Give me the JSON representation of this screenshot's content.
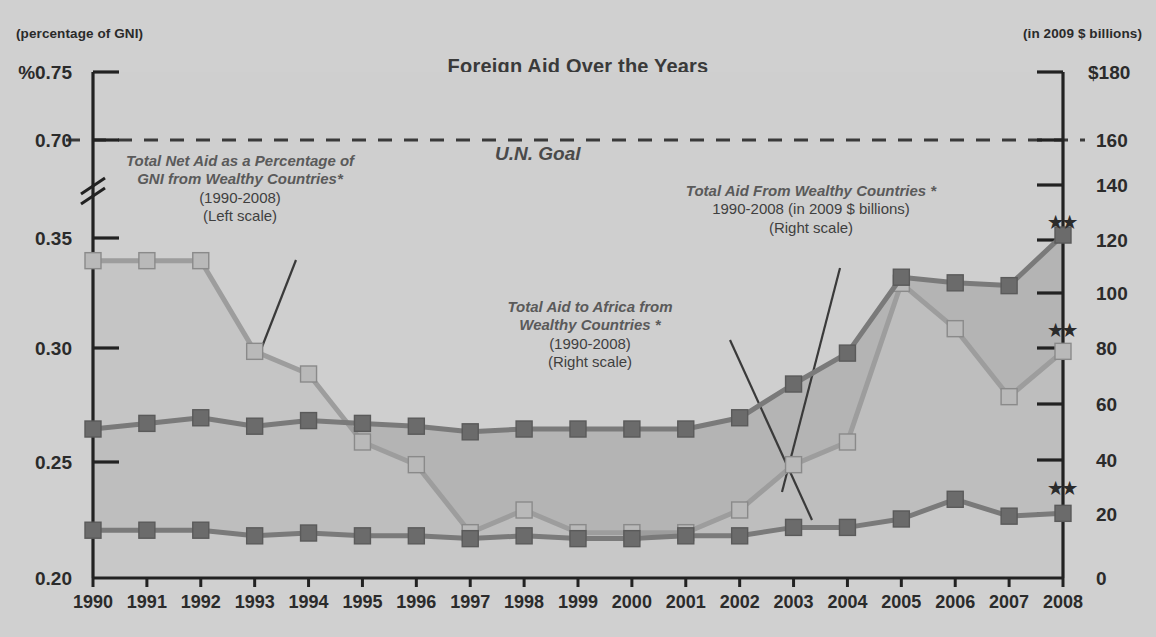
{
  "header": {
    "left_unit_label": "(percentage of GNI)",
    "right_unit_label": "(in 2009 $ billions)",
    "title": "Foreign Aid Over the Years"
  },
  "axes": {
    "left_top_label": "%0.75",
    "left_ticks": [
      "%0.75",
      "0.70",
      "0.35",
      "0.30",
      "0.25",
      "0.20"
    ],
    "right_ticks": [
      "$180",
      "160",
      "140",
      "120",
      "100",
      "80",
      "60",
      "40",
      "20",
      "0"
    ],
    "right_top_label": "$180",
    "has_axis_break": true
  },
  "goal_line": {
    "label": "U.N. Goal",
    "left_value": 0.7,
    "style": "dashed"
  },
  "annotations": [
    {
      "name": "gni-percentage-callout",
      "line1": "Total Net Aid as a Percentage of",
      "line2": "GNI from Wealthy Countries*",
      "line3": "(1990-2008)",
      "line4": "(Left scale)"
    },
    {
      "name": "total-aid-callout",
      "line1": "Total Aid From Wealthy Countries *",
      "line2": "1990-2008 (in 2009 $ billions)",
      "line3": "(Right scale)"
    },
    {
      "name": "aid-to-africa-callout",
      "line1": "Total Aid to Africa from",
      "line2": "Wealthy Countries *",
      "line3": "(1990-2008)",
      "line4": "(Right scale)"
    }
  ],
  "footnote_markers": {
    "double_star": "★★",
    "count": 3
  },
  "colors": {
    "background": "#d3d3d3",
    "plot_fill_light": "#c0c0c0",
    "plot_fill_dark": "#b0b0b0",
    "series_gni": "#9a9a9a",
    "series_total_aid": "#6e6e6e",
    "series_africa": "#6e6e6e",
    "axis": "#222222",
    "text": "#2b2b2b"
  },
  "chart_data": {
    "type": "line",
    "title": "Foreign Aid Over the Years",
    "xlabel": "",
    "ylabel": "percentage of GNI",
    "y2label": "in 2009 $ billions",
    "grid": false,
    "legend": "annotations-inline",
    "categories": [
      1990,
      1991,
      1992,
      1993,
      1994,
      1995,
      1996,
      1997,
      1998,
      1999,
      2000,
      2001,
      2002,
      2003,
      2004,
      2005,
      2006,
      2007,
      2008
    ],
    "ylim": [
      0.2,
      0.75
    ],
    "y_break": [
      0.36,
      0.69
    ],
    "y2lim": [
      0,
      180
    ],
    "y_ticks": [
      0.2,
      0.25,
      0.3,
      0.35,
      0.7,
      0.75
    ],
    "y2_ticks": [
      0,
      20,
      40,
      60,
      80,
      100,
      120,
      140,
      160,
      180
    ],
    "reference_lines": [
      {
        "label": "U.N. Goal",
        "axis": "left",
        "value": 0.7
      }
    ],
    "series": [
      {
        "name": "Total Net Aid as a Percentage of GNI from Wealthy Countries",
        "axis": "left",
        "units": "percentage of GNI",
        "color": "#9a9a9a",
        "values": [
          0.34,
          0.34,
          0.34,
          0.3,
          0.29,
          0.26,
          0.25,
          0.22,
          0.23,
          0.22,
          0.22,
          0.22,
          0.23,
          0.25,
          0.26,
          0.33,
          0.31,
          0.28,
          0.3
        ]
      },
      {
        "name": "Total Aid From Wealthy Countries",
        "axis": "right",
        "units": "2009 $ billions",
        "color": "#6e6e6e",
        "values": [
          53,
          55,
          57,
          54,
          56,
          55,
          54,
          52,
          53,
          53,
          53,
          53,
          57,
          69,
          80,
          107,
          105,
          104,
          122
        ]
      },
      {
        "name": "Total Aid to Africa from Wealthy Countries",
        "axis": "right",
        "units": "2009 $ billions",
        "color": "#6e6e6e",
        "values": [
          17,
          17,
          17,
          15,
          16,
          15,
          15,
          14,
          15,
          14,
          14,
          15,
          15,
          18,
          18,
          21,
          28,
          22,
          23
        ]
      }
    ]
  }
}
